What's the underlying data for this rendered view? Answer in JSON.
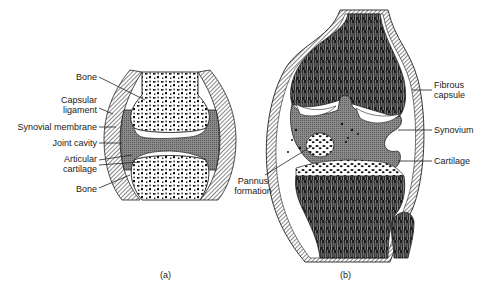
{
  "figure": {
    "type": "anatomical-diagram"
  },
  "panel_a": {
    "tag": "(a)",
    "labels": {
      "bone_top": "Bone",
      "capsular_ligament_1": "Capsular",
      "capsular_ligament_2": "ligament",
      "synovial_membrane": "Synovial membrane",
      "joint_cavity": "Joint cavity",
      "articular_cartilage_1": "Articular",
      "articular_cartilage_2": "cartilage",
      "bone_bottom": "Bone"
    }
  },
  "panel_b": {
    "tag": "(b)",
    "labels": {
      "fibrous_capsule_1": "Fibrous",
      "fibrous_capsule_2": "capsule",
      "synovium": "Synovium",
      "cartilage": "Cartilage",
      "pannus_formation_1": "Pannus",
      "pannus_formation_2": "formation"
    }
  },
  "colors": {
    "ink": "#1a1a1a",
    "cavity_gray": "#7a7a7a",
    "background": "#ffffff"
  }
}
